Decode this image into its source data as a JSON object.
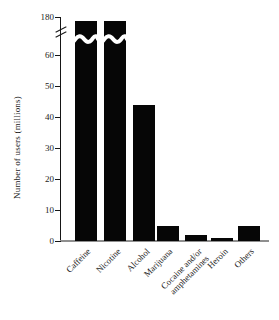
{
  "chart_data": {
    "type": "bar",
    "title": "",
    "xlabel": "",
    "ylabel": "Number of users (millions)",
    "categories": [
      "Caffeine",
      "Nicotine",
      "Alcohol",
      "Marijuana",
      "Cocaine and/or\namphetamines",
      "Heroin",
      "Others"
    ],
    "values": [
      176,
      63,
      44,
      5,
      2,
      1,
      5
    ],
    "y_ticks_lower": [
      0,
      10,
      20,
      30,
      40,
      50,
      60
    ],
    "y_tick_upper": 180,
    "ylim": [
      0,
      180
    ],
    "axis_break": {
      "between": [
        60,
        180
      ],
      "bar_with_break": "Caffeine"
    },
    "grid": false,
    "legend": null,
    "bar_color": "#060606"
  },
  "colors": {
    "background": "#ffffff",
    "bar": "#060606",
    "axis": "#161616",
    "baseline": "#8f8f8f",
    "text": "#1c1c1c"
  }
}
